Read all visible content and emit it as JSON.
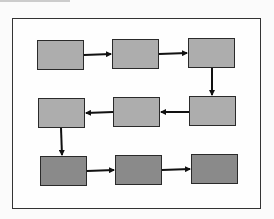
{
  "diagram": {
    "type": "flowchart",
    "colors": {
      "frame_border": "#333333",
      "box_border": "#2a2a2a",
      "light_box_fill": "#adadad",
      "dark_box_fill": "#8a8a8a",
      "arrow": "#111111"
    },
    "nodes": [
      {
        "id": "n1",
        "row": 1,
        "col": 1,
        "label": "",
        "shade": "light",
        "x": 37,
        "y": 40
      },
      {
        "id": "n2",
        "row": 1,
        "col": 2,
        "label": "",
        "shade": "light",
        "x": 112,
        "y": 39
      },
      {
        "id": "n3",
        "row": 1,
        "col": 3,
        "label": "",
        "shade": "light",
        "x": 188,
        "y": 38
      },
      {
        "id": "n4",
        "row": 2,
        "col": 3,
        "label": "",
        "shade": "light",
        "x": 189,
        "y": 96
      },
      {
        "id": "n5",
        "row": 2,
        "col": 2,
        "label": "",
        "shade": "light",
        "x": 113,
        "y": 97
      },
      {
        "id": "n6",
        "row": 2,
        "col": 1,
        "label": "",
        "shade": "light",
        "x": 38,
        "y": 98
      },
      {
        "id": "n7",
        "row": 3,
        "col": 1,
        "label": "",
        "shade": "dark",
        "x": 40,
        "y": 156
      },
      {
        "id": "n8",
        "row": 3,
        "col": 2,
        "label": "",
        "shade": "dark",
        "x": 115,
        "y": 155
      },
      {
        "id": "n9",
        "row": 3,
        "col": 3,
        "label": "",
        "shade": "dark",
        "x": 191,
        "y": 154
      }
    ],
    "edges": [
      {
        "from": "n1",
        "to": "n2",
        "direction": "right"
      },
      {
        "from": "n2",
        "to": "n3",
        "direction": "right"
      },
      {
        "from": "n3",
        "to": "n4",
        "direction": "down"
      },
      {
        "from": "n4",
        "to": "n5",
        "direction": "left"
      },
      {
        "from": "n5",
        "to": "n6",
        "direction": "left"
      },
      {
        "from": "n6",
        "to": "n7",
        "direction": "down"
      },
      {
        "from": "n7",
        "to": "n8",
        "direction": "right"
      },
      {
        "from": "n8",
        "to": "n9",
        "direction": "right"
      }
    ]
  }
}
